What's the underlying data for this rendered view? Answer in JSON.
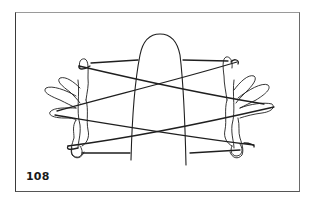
{
  "figure": {
    "number_label": "108",
    "icons": [
      "left-hand-icon",
      "right-hand-icon",
      "center-finger-icon",
      "string-icon"
    ],
    "colors": {
      "ink": "#1f1f1f",
      "background": "#ffffff",
      "frame_border": "#555555"
    }
  }
}
